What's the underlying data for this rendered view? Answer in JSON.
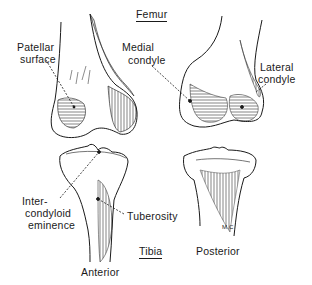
{
  "figure": {
    "section_titles": {
      "femur": "Femur",
      "tibia": "Tibia"
    },
    "view_labels": {
      "anterior": "Anterior",
      "posterior": "Posterior"
    },
    "femur_labels": {
      "patellar_surface_line1": "Patellar",
      "patellar_surface_line2": "surface",
      "medial_condyle_line1": "Medial",
      "medial_condyle_line2": "condyle",
      "lateral_condyle_line1": "Lateral",
      "lateral_condyle_line2": "condyle"
    },
    "tibia_labels": {
      "intercondyloid_line1": "Inter-",
      "intercondyloid_line2": "condyloid",
      "intercondyloid_line3": "eminence",
      "tuberosity": "Tuberosity"
    },
    "signature": "M.C",
    "colors": {
      "ink": "#1a1a1a",
      "background": "#ffffff"
    }
  }
}
